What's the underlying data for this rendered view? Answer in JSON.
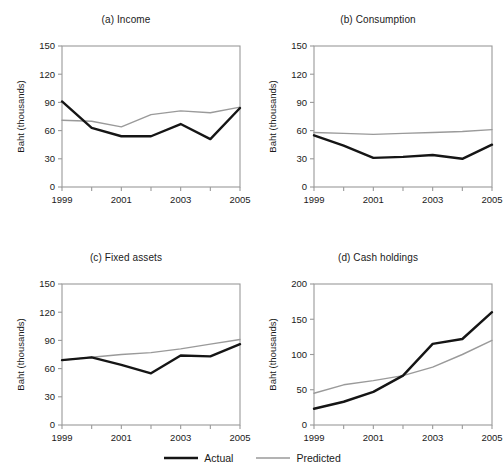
{
  "chart_data": [
    {
      "type": "line",
      "panel": "a",
      "title": "(a) Income",
      "xlabel": "",
      "ylabel": "Baht (thousands)",
      "x": [
        1999,
        2000,
        2001,
        2002,
        2003,
        2004,
        2005
      ],
      "xticklabels": [
        "1999",
        "2001",
        "2003",
        "2005"
      ],
      "yticks": [
        0,
        30,
        60,
        90,
        120,
        150
      ],
      "ylim": [
        0,
        150
      ],
      "grid": false,
      "series": [
        {
          "name": "Actual",
          "values": [
            91,
            63,
            54,
            54,
            67,
            51,
            84
          ]
        },
        {
          "name": "Predicted",
          "values": [
            71,
            70,
            64,
            77,
            81,
            79,
            85
          ]
        }
      ]
    },
    {
      "type": "line",
      "panel": "b",
      "title": "(b) Consumption",
      "xlabel": "",
      "ylabel": "Baht (thousands)",
      "x": [
        1999,
        2000,
        2001,
        2002,
        2003,
        2004,
        2005
      ],
      "xticklabels": [
        "1999",
        "2001",
        "2003",
        "2005"
      ],
      "yticks": [
        0,
        30,
        60,
        90,
        120,
        150
      ],
      "ylim": [
        0,
        150
      ],
      "grid": false,
      "series": [
        {
          "name": "Actual",
          "values": [
            55,
            44,
            31,
            32,
            34,
            30,
            45
          ]
        },
        {
          "name": "Predicted",
          "values": [
            58,
            57,
            56,
            57,
            58,
            59,
            61
          ]
        }
      ]
    },
    {
      "type": "line",
      "panel": "c",
      "title": "(c) Fixed assets",
      "xlabel": "",
      "ylabel": "Baht (thousands)",
      "x": [
        1999,
        2000,
        2001,
        2002,
        2003,
        2004,
        2005
      ],
      "xticklabels": [
        "1999",
        "2001",
        "2003",
        "2005"
      ],
      "yticks": [
        0,
        30,
        60,
        90,
        120,
        150
      ],
      "ylim": [
        0,
        150
      ],
      "grid": false,
      "series": [
        {
          "name": "Actual",
          "values": [
            69,
            72,
            64,
            55,
            74,
            73,
            86
          ]
        },
        {
          "name": "Predicted",
          "values": [
            69,
            72,
            75,
            77,
            81,
            86,
            91
          ]
        }
      ]
    },
    {
      "type": "line",
      "panel": "d",
      "title": "(d) Cash holdings",
      "xlabel": "",
      "ylabel": "Baht (thousands)",
      "x": [
        1999,
        2000,
        2001,
        2002,
        2003,
        2004,
        2005
      ],
      "xticklabels": [
        "1999",
        "2001",
        "2003",
        "2005"
      ],
      "yticks": [
        0,
        50,
        100,
        150,
        200
      ],
      "ylim": [
        0,
        200
      ],
      "grid": false,
      "series": [
        {
          "name": "Actual",
          "values": [
            23,
            33,
            47,
            70,
            115,
            122,
            160
          ]
        },
        {
          "name": "Predicted",
          "values": [
            45,
            57,
            63,
            70,
            82,
            100,
            120
          ]
        }
      ]
    }
  ],
  "legend": {
    "position": "bottom-center",
    "items": [
      {
        "label": "Actual",
        "color": "#151515",
        "width": 2.4
      },
      {
        "label": "Predicted",
        "color": "#9a9a9a",
        "width": 1.4
      }
    ]
  },
  "style": {
    "actual_color": "#151515",
    "predicted_color": "#9a9a9a",
    "frame_color": "#9a9a9a",
    "text_color": "#1a1a1a",
    "background": "#ffffff"
  }
}
